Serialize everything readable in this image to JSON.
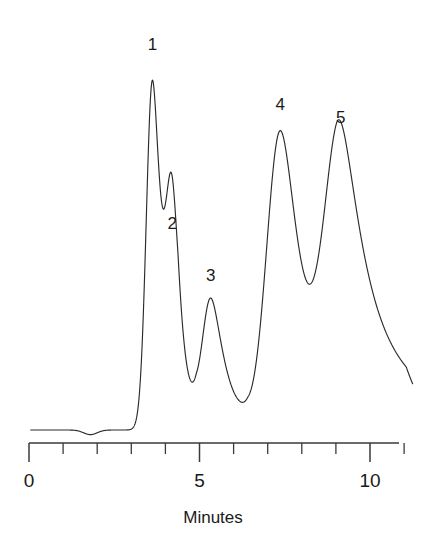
{
  "chart_data": {
    "type": "line",
    "title": "",
    "subtitle": "",
    "xlabel": "Minutes",
    "ylabel": "",
    "xlim": [
      0,
      11.3
    ],
    "ylim": [
      0,
      1.0
    ],
    "grid": false,
    "legend": "none",
    "axis": {
      "major_ticks": [
        {
          "value": 0,
          "label": "0"
        },
        {
          "value": 5,
          "label": "5"
        },
        {
          "value": 10,
          "label": "10"
        }
      ],
      "minor_ticks": [
        1,
        2,
        3,
        4,
        6,
        7,
        8,
        9,
        11
      ]
    },
    "annotations": [
      {
        "text": "1",
        "x": 3.62,
        "y": 0.985
      },
      {
        "text": "2",
        "x": 4.2,
        "y": 0.52
      },
      {
        "text": "3",
        "x": 5.33,
        "y": 0.385
      },
      {
        "text": "4",
        "x": 7.37,
        "y": 0.83
      },
      {
        "text": "5",
        "x": 9.14,
        "y": 0.795
      }
    ],
    "peaks": [
      {
        "label": "1",
        "retention_time": 3.62,
        "height": 0.905,
        "width": 0.18,
        "tail": 0.1
      },
      {
        "label": "2",
        "retention_time": 4.2,
        "height": 0.47,
        "width": 0.17,
        "tail": 0.09
      },
      {
        "label": "3",
        "retention_time": 5.33,
        "height": 0.34,
        "width": 0.26,
        "tail": 0.14
      },
      {
        "label": "4",
        "retention_time": 7.37,
        "height": 0.775,
        "width": 0.4,
        "tail": 0.2
      },
      {
        "label": "5",
        "retention_time": 9.14,
        "height": 0.74,
        "width": 0.46,
        "tail": 0.34
      }
    ],
    "baseline": {
      "start_x": 0.05,
      "end_x": 11.25,
      "level": 0.0,
      "noise_dip_x": 1.8,
      "noise_dip_depth": 0.012
    }
  },
  "figure": {
    "background_color": "#ffffff",
    "trace_color": "#2b2b2b",
    "axis_color": "#3a3a3a",
    "text_color": "#1a1a1a"
  }
}
